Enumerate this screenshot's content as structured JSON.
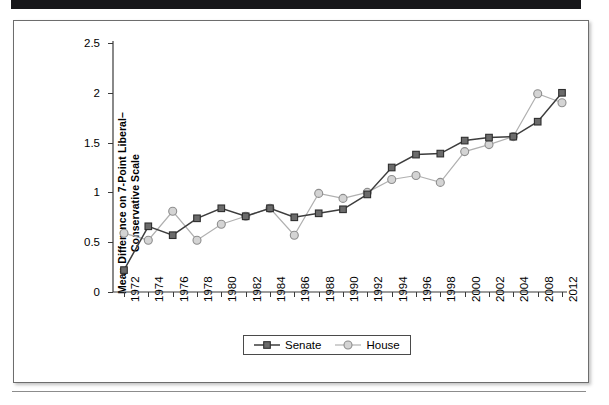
{
  "figure": {
    "ylabel_line1": "Mean Difference on 7-Point Liberal–",
    "ylabel_line2": "Conservative Scale"
  },
  "colors": {
    "senate_line": "#3d3d3d",
    "senate_marker_fill": "#6b6b6b",
    "house_line": "#b0b0b0",
    "house_marker_fill": "#d4d4d4",
    "axis": "#3a3a3a",
    "frame": "#6d6d6d",
    "top_bar": "#17171a"
  },
  "chart_data": {
    "type": "line",
    "title": "",
    "xlabel": "",
    "ylabel": "Mean Difference on 7-Point Liberal–Conservative Scale",
    "categories": [
      "1972",
      "1974",
      "1976",
      "1978",
      "1980",
      "1982",
      "1984",
      "1986",
      "1988",
      "1990",
      "1992",
      "1994",
      "1996",
      "1998",
      "2000",
      "2002",
      "2004",
      "2008",
      "2012"
    ],
    "yticks": [
      0,
      0.5,
      1,
      1.5,
      2,
      2.5
    ],
    "ytick_labels": [
      "0",
      "0.5",
      "1",
      "1.5",
      "2",
      "2.5"
    ],
    "ylim": [
      0,
      2.5
    ],
    "grid": false,
    "legend_position": "bottom-center",
    "series": [
      {
        "name": "Senate",
        "marker": "filled-square",
        "values": [
          0.22,
          0.66,
          0.57,
          0.74,
          0.84,
          0.76,
          0.84,
          0.75,
          0.79,
          0.83,
          0.98,
          1.25,
          1.38,
          1.39,
          1.52,
          1.55,
          1.56,
          1.71,
          2.0
        ]
      },
      {
        "name": "House",
        "marker": "open-circle",
        "values": [
          0.59,
          0.52,
          0.81,
          0.52,
          0.68,
          0.76,
          0.84,
          0.57,
          0.99,
          0.94,
          1.0,
          1.13,
          1.17,
          1.1,
          1.41,
          1.48,
          1.56,
          1.99,
          1.9
        ]
      }
    ]
  },
  "legend": {
    "items": [
      {
        "label": "Senate"
      },
      {
        "label": "House"
      }
    ]
  }
}
